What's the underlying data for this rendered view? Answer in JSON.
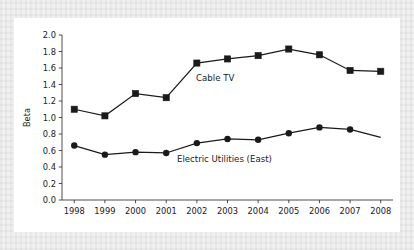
{
  "chart_data": {
    "type": "line",
    "title": "",
    "xlabel": "",
    "ylabel": "Beta",
    "x": [
      1998,
      1999,
      2000,
      2001,
      2002,
      2003,
      2004,
      2005,
      2006,
      2007,
      2008
    ],
    "categories": [
      "1998",
      "1999",
      "2000",
      "2001",
      "2002",
      "2003",
      "2004",
      "2005",
      "2006",
      "2007",
      "2008"
    ],
    "xlim": [
      1997.6,
      2008.4
    ],
    "ylim": [
      0.0,
      2.0
    ],
    "yticks": [
      "0.0",
      "0.2",
      "0.4",
      "0.6",
      "0.8",
      "1.0",
      "1.2",
      "1.4",
      "1.6",
      "1.8",
      "2.0"
    ],
    "ytick_values": [
      0.0,
      0.2,
      0.4,
      0.6,
      0.8,
      1.0,
      1.2,
      1.4,
      1.6,
      1.8,
      2.0
    ],
    "grid": false,
    "legend_position": "inline-annotation",
    "series": [
      {
        "name": "Cable TV",
        "marker": "square",
        "color": "#1a1a1a",
        "values": [
          1.1,
          1.02,
          1.29,
          1.24,
          1.66,
          1.71,
          1.75,
          1.83,
          1.76,
          1.57,
          1.56
        ],
        "label_x": 2002.6,
        "label_y": 1.44
      },
      {
        "name": "Electric Utilities (East)",
        "marker": "circle",
        "color": "#1a1a1a",
        "values": [
          0.66,
          0.55,
          0.58,
          0.57,
          0.69,
          0.74,
          0.73,
          0.81,
          0.88,
          0.855,
          0.76
        ],
        "last_point_has_marker": false,
        "label_x": 2002.9,
        "label_y": 0.455
      }
    ]
  }
}
